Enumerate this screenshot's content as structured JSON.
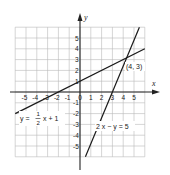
{
  "chart_data": {
    "type": "line",
    "title": "",
    "xlabel": "x",
    "ylabel": "y",
    "xlim": [
      -6,
      6
    ],
    "ylim": [
      -6,
      6
    ],
    "grid": true,
    "x_ticks": [
      "-5",
      "-4",
      "-3",
      "-2",
      "-1",
      "0",
      "1",
      "2",
      "3",
      "4",
      "5"
    ],
    "y_ticks": [
      "5",
      "4",
      "3",
      "2",
      "1",
      "-1",
      "-2",
      "-3",
      "-4",
      "-5"
    ],
    "series": [
      {
        "name": "y = 1/2 x + 1",
        "equation": "y = (1/2)x + 1",
        "points": [
          [
            -6,
            -2
          ],
          [
            6,
            4
          ]
        ],
        "y_intercept": 1,
        "x_intercept": -2
      },
      {
        "name": "2x - y = 5",
        "equation": "2x - y = 5",
        "points": [
          [
            0.5,
            -6
          ],
          [
            5.5,
            6
          ]
        ],
        "y_intercept": -5,
        "x_intercept": 2.5
      }
    ],
    "annotations": [
      {
        "text": "(4, 3)",
        "x": 4,
        "y": 3,
        "note": "intersection point"
      }
    ]
  },
  "labels": {
    "x_axis": "x",
    "y_axis": "y",
    "eq1_lhs": "y =",
    "eq1_num": "1",
    "eq1_den": "2",
    "eq1_rhs": "x + 1",
    "eq2": "2 x − y = 5",
    "intersection": "(4, 3)",
    "origin": "0"
  }
}
